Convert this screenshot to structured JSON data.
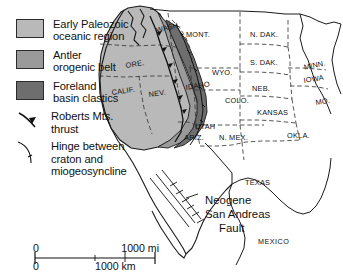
{
  "legend": {
    "items": [
      {
        "symbol": "swatch",
        "color": "#b9b9b9",
        "line1": "Early Paleozoic",
        "line2": "oceanic region"
      },
      {
        "symbol": "swatch",
        "color": "#9a9a9a",
        "line1": "Antler",
        "line2": "orogenic belt"
      },
      {
        "symbol": "swatch",
        "color": "#6e6e6e",
        "line1": "Foreland",
        "line2": "basin clastics"
      },
      {
        "symbol": "thrust-arrow",
        "color": "#111111",
        "line1": "Roberts Mts.",
        "line2": "thrust"
      },
      {
        "symbol": "hinge-line",
        "color": "#111111",
        "line1": "Hinge between",
        "line2": "craton and",
        "line3": "miogeosyncline"
      }
    ]
  },
  "scale": {
    "miles_zero": "0",
    "miles_max": "1000 mi",
    "km_zero": "0",
    "km_max": "1000 km"
  },
  "map": {
    "annotations": [
      {
        "text": "Neogene",
        "x": 205,
        "y": 194
      },
      {
        "text": "San Andreas",
        "x": 205,
        "y": 208
      },
      {
        "text": "Fault",
        "x": 219,
        "y": 222
      }
    ],
    "country_labels": [
      {
        "text": "MEXICO",
        "x": 258,
        "y": 237
      }
    ],
    "states": [
      {
        "text": "WASH.",
        "x": 155,
        "y": 26,
        "rot": -14
      },
      {
        "text": "ORE.",
        "x": 125,
        "y": 61,
        "rot": -9
      },
      {
        "text": "CALIF.",
        "x": 111,
        "y": 88,
        "rot": -8
      },
      {
        "text": "NEV.",
        "x": 148,
        "y": 90,
        "rot": -8
      },
      {
        "text": "IDAHO",
        "x": 185,
        "y": 83,
        "rot": -8
      },
      {
        "text": "MONT.",
        "x": 186,
        "y": 30,
        "rot": 0
      },
      {
        "text": "WYO.",
        "x": 212,
        "y": 68,
        "rot": 0
      },
      {
        "text": "UTAH",
        "x": 195,
        "y": 122,
        "rot": 0
      },
      {
        "text": "ARIZ.",
        "x": 184,
        "y": 133,
        "rot": 0
      },
      {
        "text": "COLO.",
        "x": 225,
        "y": 96,
        "rot": 0
      },
      {
        "text": "N. MEX.",
        "x": 219,
        "y": 133,
        "rot": 0
      },
      {
        "text": "N. DAK.",
        "x": 250,
        "y": 30,
        "rot": 0
      },
      {
        "text": "S. DAK.",
        "x": 250,
        "y": 58,
        "rot": 0
      },
      {
        "text": "NEB.",
        "x": 252,
        "y": 84,
        "rot": 0
      },
      {
        "text": "KANSAS",
        "x": 257,
        "y": 108,
        "rot": 0
      },
      {
        "text": "OKLA.",
        "x": 287,
        "y": 131,
        "rot": 0
      },
      {
        "text": "TEXAS",
        "x": 245,
        "y": 178,
        "rot": 0
      },
      {
        "text": "MINN.",
        "x": 303,
        "y": 63,
        "rot": -12
      },
      {
        "text": "IOWA",
        "x": 303,
        "y": 76,
        "rot": -9
      },
      {
        "text": "MO.",
        "x": 315,
        "y": 98,
        "rot": -9
      }
    ]
  },
  "colors": {
    "oceanic": "#b9b9b9",
    "antler": "#9a9a9a",
    "foreland": "#6e6e6e",
    "outline": "#1a1a1a",
    "state_border": "#3a3a3a",
    "background": "#ffffff"
  }
}
